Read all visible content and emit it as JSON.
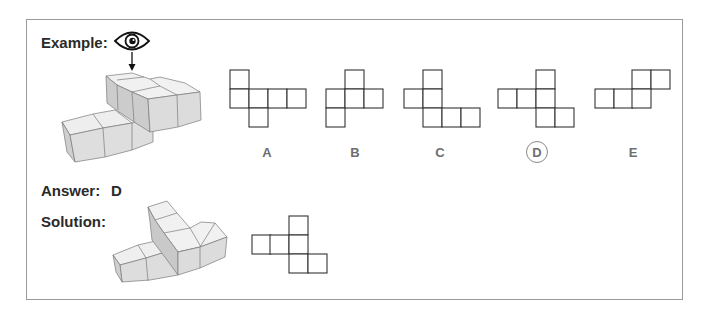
{
  "labels": {
    "example": "Example:",
    "answer": "Answer:",
    "answer_value": "D",
    "solution": "Solution:"
  },
  "icons": {
    "viewpoint": "eye-icon",
    "direction": "arrow-down-icon"
  },
  "options": [
    {
      "label": "A",
      "selected": false,
      "cells": [
        [
          0,
          0
        ],
        [
          0,
          1
        ],
        [
          1,
          1
        ],
        [
          2,
          1
        ],
        [
          3,
          1
        ],
        [
          1,
          2
        ]
      ]
    },
    {
      "label": "B",
      "selected": false,
      "cells": [
        [
          1,
          0
        ],
        [
          0,
          1
        ],
        [
          1,
          1
        ],
        [
          2,
          1
        ],
        [
          0,
          2
        ]
      ]
    },
    {
      "label": "C",
      "selected": false,
      "cells": [
        [
          1,
          0
        ],
        [
          0,
          1
        ],
        [
          1,
          1
        ],
        [
          1,
          2
        ],
        [
          2,
          2
        ],
        [
          3,
          2
        ]
      ]
    },
    {
      "label": "D",
      "selected": true,
      "cells": [
        [
          2,
          0
        ],
        [
          0,
          1
        ],
        [
          1,
          1
        ],
        [
          2,
          1
        ],
        [
          2,
          2
        ],
        [
          3,
          2
        ]
      ]
    },
    {
      "label": "E",
      "selected": false,
      "cells": [
        [
          2,
          0
        ],
        [
          3,
          0
        ],
        [
          0,
          1
        ],
        [
          1,
          1
        ],
        [
          2,
          1
        ]
      ]
    }
  ],
  "solution_net": {
    "cells": [
      [
        2,
        0
      ],
      [
        0,
        1
      ],
      [
        1,
        1
      ],
      [
        2,
        1
      ],
      [
        2,
        2
      ],
      [
        3,
        2
      ]
    ]
  },
  "colors": {
    "frame": "#9a9a9a",
    "grid_line": "#333333",
    "cube_top": "#f0f0f0",
    "cube_front": "#dcdcdc",
    "cube_side": "#c8c8c8",
    "option_label": "#6e6e6e"
  }
}
